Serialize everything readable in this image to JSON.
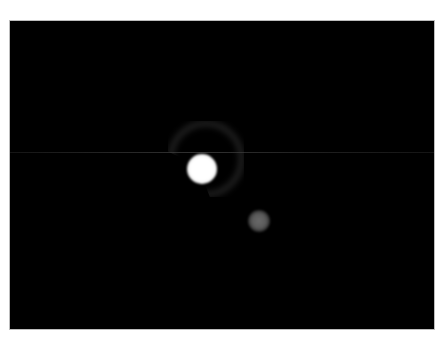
{
  "image": {
    "kind": "telescope-frame",
    "background_color": "#000000",
    "frame_border_color": "#bdbdbd",
    "objects": [
      {
        "name": "primary-bright-source",
        "center": [
          201,
          168
        ],
        "radius": 15,
        "color": "#ffffff"
      },
      {
        "name": "ring-halo",
        "center": [
          205,
          165
        ],
        "radius": 36,
        "color": "#464646"
      },
      {
        "name": "secondary-faint-source",
        "center": [
          258,
          219
        ],
        "radius": 11,
        "color": "#5e5e5e"
      }
    ],
    "artifacts": [
      {
        "name": "horizontal-scanline",
        "y": 151,
        "color": "#5a5a5a"
      }
    ]
  }
}
